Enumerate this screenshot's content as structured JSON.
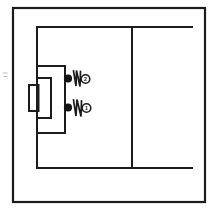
{
  "diagram": {
    "style": "hand-drawn scanned line drawing",
    "background_color": "#ffffff",
    "ink_color": "#1c1c1c",
    "border": {
      "label": "outer frame border",
      "x": 13,
      "y": 8,
      "width": 192,
      "height": 194,
      "stroke_width": 2.2
    },
    "pitch": {
      "penalty_area": {
        "label": "penalty area",
        "x": 37,
        "y": 27,
        "width": 155,
        "height": 141,
        "stroke_width": 2.0
      },
      "goal_area": {
        "label": "goal area",
        "x": 37,
        "y": 66,
        "width": 28,
        "height": 67,
        "stroke_width": 2.0
      },
      "inner_goal_box": {
        "label": "inner goal box",
        "x": 37,
        "y": 78,
        "width": 14,
        "height": 40,
        "stroke_width": 2.0
      },
      "goal_mouth": {
        "label": "goal mouth",
        "x": 29,
        "y": 85,
        "width": 9,
        "height": 26,
        "stroke_width": 2.0
      },
      "halfway_line": {
        "label": "halfway line",
        "x": 132,
        "y1": 27,
        "y2": 168,
        "stroke_width": 2.0
      }
    },
    "annotations": [
      {
        "label": "player-marker-upper",
        "dot": {
          "cx": 68,
          "cy": 78,
          "r": 4.1
        },
        "squiggle": "zigzag movement stroke",
        "squiggle_path": "M 73 71 L 76 85 L 76 71 L 80 86 L 80 72",
        "badge": {
          "cx": 85,
          "cy": 79,
          "r": 4.3,
          "number": "2"
        }
      },
      {
        "label": "player-marker-lower",
        "dot": {
          "cx": 68,
          "cy": 107,
          "r": 4.1
        },
        "squiggle": "zigzag movement stroke",
        "squiggle_path": "M 73 100 L 76 115 L 77 100 L 81 116 L 81 101",
        "badge": {
          "cx": 86,
          "cy": 108,
          "r": 4.3,
          "number": "1"
        }
      }
    ],
    "edge_marks": [
      {
        "label": "faint-left-margin-tick",
        "x1": 3,
        "y1": 73,
        "x2": 7,
        "y2": 73
      },
      {
        "label": "faint-left-margin-tick-2",
        "x1": 4,
        "y1": 76,
        "x2": 7,
        "y2": 76
      }
    ]
  }
}
